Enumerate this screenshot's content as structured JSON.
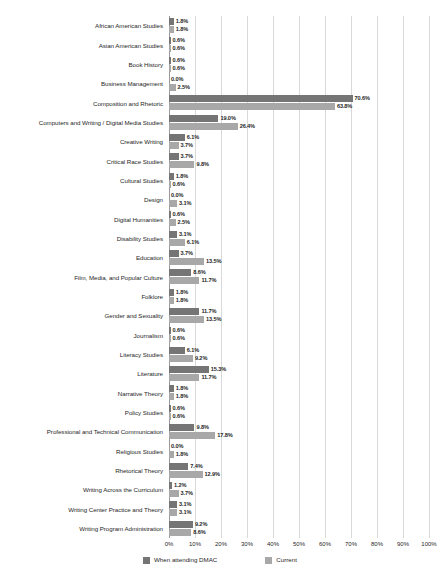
{
  "chart_data": {
    "type": "bar",
    "orientation": "horizontal",
    "title": "",
    "xlabel": "",
    "ylabel": "",
    "xlim": [
      0,
      100
    ],
    "xticks": [
      "0%",
      "10%",
      "20%",
      "30%",
      "40%",
      "50%",
      "60%",
      "70%",
      "80%",
      "90%",
      "100%"
    ],
    "xtick_values": [
      0,
      10,
      20,
      30,
      40,
      50,
      60,
      70,
      80,
      90,
      100
    ],
    "grid": true,
    "grid_axis": "x",
    "legend_position": "bottom",
    "value_labels": true,
    "value_label_suffix": "%",
    "categories": [
      "African American Studies",
      "Asian American Studies",
      "Book History",
      "Business Management",
      "Composition and Rhetoric",
      "Computers and Writing / Digital Media Studies",
      "Creative Writing",
      "Critical Race Studies",
      "Cultural Studies",
      "Design",
      "Digital Humanities",
      "Disability Studies",
      "Education",
      "Film, Media, and Popular Culture",
      "Folklore",
      "Gender and Sexuality",
      "Journalism",
      "Literacy Studies",
      "Literature",
      "Narrative Theory",
      "Policy Studies",
      "Professional and Technical Communication",
      "Religious Studies",
      "Rhetorical Theory",
      "Writing Across the Curriculum",
      "Writing Center Practice and Theory",
      "Writing Program Administration"
    ],
    "series": [
      {
        "name": "When attending DMAC",
        "color": "#757575",
        "values": [
          1.8,
          0.6,
          0.6,
          0.0,
          70.6,
          19.0,
          6.1,
          3.7,
          1.8,
          0.0,
          0.6,
          3.1,
          3.7,
          8.6,
          1.8,
          11.7,
          0.6,
          6.1,
          15.3,
          1.8,
          0.6,
          9.8,
          0.0,
          7.4,
          1.2,
          3.1,
          9.2
        ],
        "labels": [
          "1.8%",
          "0.6%",
          "0.6%",
          "0.0%",
          "70.6%",
          "19.0%",
          "6.1%",
          "3.7%",
          "1.8%",
          "0.0%",
          "0.6%",
          "3.1%",
          "3.7%",
          "8.6%",
          "1.8%",
          "11.7%",
          "0.6%",
          "6.1%",
          "15.3%",
          "1.8%",
          "0.6%",
          "9.8%",
          "0.0%",
          "7.4%",
          "1.2%",
          "3.1%",
          "9.2%"
        ]
      },
      {
        "name": "Current",
        "color": "#a8a8a8",
        "values": [
          1.8,
          0.6,
          0.6,
          2.5,
          63.8,
          26.4,
          3.7,
          9.8,
          0.6,
          3.1,
          2.5,
          6.1,
          13.5,
          11.7,
          1.8,
          13.5,
          0.6,
          9.2,
          11.7,
          1.8,
          0.6,
          17.8,
          1.8,
          12.9,
          3.7,
          3.1,
          8.6
        ],
        "labels": [
          "1.8%",
          "0.6%",
          "0.6%",
          "2.5%",
          "63.8%",
          "26.4%",
          "3.7%",
          "9.8%",
          "0.6%",
          "3.1%",
          "2.5%",
          "6.1%",
          "13.5%",
          "11.7%",
          "1.8%",
          "13.5%",
          "0.6%",
          "9.2%",
          "11.7%",
          "1.8%",
          "0.6%",
          "17.8%",
          "1.8%",
          "12.9%",
          "3.7%",
          "3.1%",
          "8.6%"
        ]
      }
    ]
  }
}
